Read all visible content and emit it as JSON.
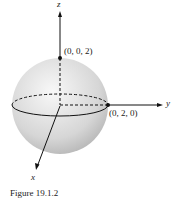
{
  "figure": {
    "caption": "Figure 19.1.2",
    "axes": {
      "x": "x",
      "y": "y",
      "z": "z"
    },
    "points": [
      {
        "label": "(0, 0, 2)"
      },
      {
        "label": "(0, 2, 0)"
      }
    ],
    "colors": {
      "sphere_light": "#f4f4f4",
      "sphere_dark": "#b8b8b8",
      "ink": "#111111"
    }
  }
}
